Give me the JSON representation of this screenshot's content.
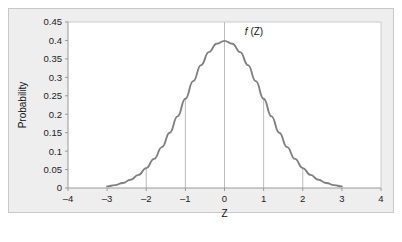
{
  "chart_data": {
    "type": "line",
    "title": "",
    "xlabel": "Z",
    "ylabel": "Probability",
    "xlim": [
      -4,
      4
    ],
    "ylim": [
      0,
      0.45
    ],
    "grid": false,
    "legend": "none",
    "curve_label": "f (Z)",
    "curve_label_italic_part": "f",
    "curve_label_rest": " (Z)",
    "curve_color": "#808080",
    "plot_background": "#ffffff",
    "frame_background": "#eeeeee",
    "axis_color": "#999999",
    "dropline_color": "#aaaaaa",
    "x_ticks": [
      "–4",
      "–3",
      "–2",
      "–1",
      "0",
      "1",
      "2",
      "3",
      "4"
    ],
    "x_tick_values": [
      -4,
      -3,
      -2,
      -1,
      0,
      1,
      2,
      3,
      4
    ],
    "y_ticks": [
      "0",
      "0.05",
      "0.1",
      "0.15",
      "0.2",
      "0.25",
      "0.3",
      "0.35",
      "0.4",
      "0.45"
    ],
    "y_tick_values": [
      0,
      0.05,
      0.1,
      0.15,
      0.2,
      0.25,
      0.3,
      0.35,
      0.4,
      0.45
    ],
    "dropline_x_values": [
      -2,
      -1,
      1,
      2
    ],
    "center_line_x": 0,
    "curve_domain": [
      -3,
      3
    ],
    "x": [
      -3,
      -2.8,
      -2.6,
      -2.4,
      -2.2,
      -2,
      -1.8,
      -1.6,
      -1.4,
      -1.2,
      -1,
      -0.8,
      -0.6,
      -0.4,
      -0.2,
      0,
      0.2,
      0.4,
      0.6,
      0.8,
      1,
      1.2,
      1.4,
      1.6,
      1.8,
      2,
      2.2,
      2.4,
      2.6,
      2.8,
      3
    ],
    "values": [
      0.0044,
      0.0079,
      0.0136,
      0.0224,
      0.0355,
      0.054,
      0.079,
      0.1109,
      0.1497,
      0.1942,
      0.242,
      0.2897,
      0.3332,
      0.3683,
      0.391,
      0.3989,
      0.391,
      0.3683,
      0.3332,
      0.2897,
      0.242,
      0.1942,
      0.1497,
      0.1109,
      0.079,
      0.054,
      0.0355,
      0.0224,
      0.0136,
      0.0079,
      0.0044
    ],
    "series_name": "standard normal density"
  }
}
